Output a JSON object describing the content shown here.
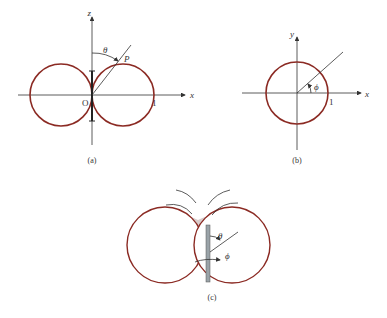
{
  "figure": {
    "panels": [
      {
        "id": "a",
        "caption": "(a)",
        "axes": {
          "vertical": "z",
          "horizontal": "x"
        },
        "labels": {
          "origin": "O",
          "point": "P",
          "angle": "θ",
          "unit_tick": "1"
        }
      },
      {
        "id": "b",
        "caption": "(b)",
        "axes": {
          "vertical": "y",
          "horizontal": "x"
        },
        "labels": {
          "angle": "ϕ",
          "unit_tick": "1"
        }
      },
      {
        "id": "c",
        "caption": "(c)",
        "labels": {
          "theta": "θ",
          "phi": "ϕ"
        }
      }
    ],
    "colors": {
      "curve": "#8B2A23",
      "axis": "#333333",
      "shade": "#D9CCCB",
      "outline": "#222222",
      "antenna": "#9AA3A8"
    }
  }
}
